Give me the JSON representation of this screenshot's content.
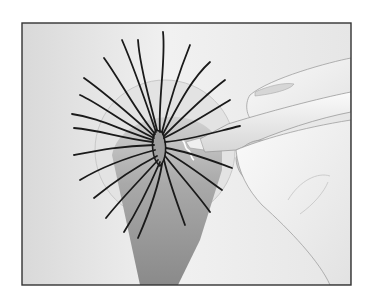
{
  "illustration": {
    "subject": "hair follicle / scalp with radiating hairs and a hand holding a pen-like instrument",
    "colors": {
      "background_light": "#f4f4f4",
      "background_mid": "#d8d8d8",
      "frame_border": "#333333",
      "hair_stroke": "#1a1a1a",
      "shadow_cone_top": "#bdbdbd",
      "shadow_cone_bottom": "#8c8c8c",
      "hand_fill": "#f0f0f0",
      "hand_outline": "#9a9a9a"
    }
  }
}
